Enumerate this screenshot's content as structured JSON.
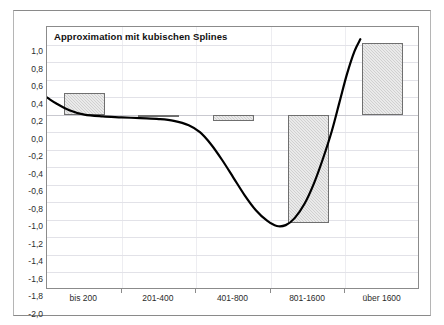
{
  "frame": {
    "clipped_top_text": ""
  },
  "chart_data": {
    "type": "bar",
    "title": "Approximation mit kubischen Splines",
    "xlabel": "",
    "ylabel": "",
    "categories": [
      "bis 200",
      "201-400",
      "401-800",
      "801-1600",
      "über 1600"
    ],
    "values": [
      0.25,
      0.0,
      -0.07,
      -1.24,
      0.82
    ],
    "ylim": [
      -2.0,
      1.0
    ],
    "ytick_labels": [
      "1,0",
      "0,8",
      "0,6",
      "0,4",
      "0,2",
      "0,0",
      "-0,2",
      "-0,4",
      "-0,6",
      "-0,8",
      "-1,0",
      "-1,2",
      "-1,4",
      "-1,6",
      "-1,8",
      "-2,0"
    ],
    "ytick_values": [
      1.0,
      0.8,
      0.6,
      0.4,
      0.2,
      0.0,
      -0.2,
      -0.4,
      -0.6,
      -0.8,
      -1.0,
      -1.2,
      -1.4,
      -1.6,
      -1.8,
      -2.0
    ],
    "grid": true,
    "legend": "none",
    "series": [
      {
        "name": "Balken",
        "type": "bar",
        "values": [
          0.25,
          0.0,
          -0.07,
          -1.24,
          0.82
        ]
      },
      {
        "name": "Kubischer Spline",
        "type": "line",
        "color": "#000000",
        "points": [
          [
            0.3,
            0.27
          ],
          [
            0.45,
            0.22
          ],
          [
            0.62,
            0.13
          ],
          [
            0.8,
            0.05
          ],
          [
            1.0,
            0.0
          ],
          [
            1.25,
            -0.02
          ],
          [
            1.5,
            -0.03
          ],
          [
            1.75,
            -0.04
          ],
          [
            2.0,
            -0.05
          ],
          [
            2.2,
            -0.07
          ],
          [
            2.4,
            -0.12
          ],
          [
            2.55,
            -0.2
          ],
          [
            2.7,
            -0.34
          ],
          [
            2.85,
            -0.52
          ],
          [
            3.0,
            -0.72
          ],
          [
            3.15,
            -0.92
          ],
          [
            3.3,
            -1.09
          ],
          [
            3.45,
            -1.21
          ],
          [
            3.58,
            -1.27
          ],
          [
            3.7,
            -1.26
          ],
          [
            3.82,
            -1.18
          ],
          [
            3.95,
            -1.02
          ],
          [
            4.08,
            -0.78
          ],
          [
            4.2,
            -0.5
          ],
          [
            4.32,
            -0.18
          ],
          [
            4.42,
            0.14
          ],
          [
            4.52,
            0.46
          ],
          [
            4.62,
            0.72
          ],
          [
            4.7,
            0.86
          ]
        ]
      }
    ]
  }
}
